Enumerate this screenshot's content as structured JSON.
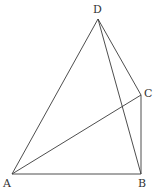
{
  "diagram": {
    "type": "geometry",
    "points": {
      "A": {
        "label": "A",
        "x": 12,
        "y": 174
      },
      "B": {
        "label": "B",
        "x": 141,
        "y": 174
      },
      "C": {
        "label": "C",
        "x": 141,
        "y": 95
      },
      "D": {
        "label": "D",
        "x": 98,
        "y": 19
      }
    },
    "segments": [
      "AB",
      "BC",
      "CA",
      "AD",
      "BD",
      "CD"
    ],
    "colors": {
      "line": "#3a3a3a",
      "text": "#333333",
      "background": "#ffffff"
    }
  }
}
